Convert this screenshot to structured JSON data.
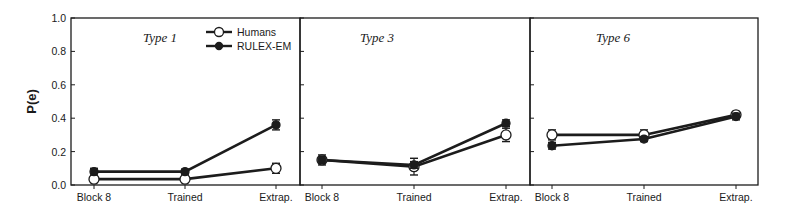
{
  "chart_data": {
    "type": "line",
    "ylabel": "P(e)",
    "ylim": [
      0.0,
      1.0
    ],
    "yticks": [
      "0.0",
      "0.2",
      "0.4",
      "0.6",
      "0.8",
      "1.0"
    ],
    "categories": [
      "Block 8",
      "Trained",
      "Extrap."
    ],
    "grid": false,
    "legend": {
      "position": "upper-right of first panel",
      "entries": [
        {
          "name": "Humans",
          "marker": "open-circle"
        },
        {
          "name": "RULEX-EM",
          "marker": "filled-circle"
        }
      ]
    },
    "panels": [
      {
        "title": "Type 1",
        "series": [
          {
            "name": "Humans",
            "values": [
              0.035,
              0.035,
              0.1
            ],
            "errors": [
              0.02,
              0.02,
              0.03
            ]
          },
          {
            "name": "RULEX-EM",
            "values": [
              0.08,
              0.08,
              0.36
            ],
            "errors": [
              0.02,
              0.015,
              0.03
            ]
          }
        ]
      },
      {
        "title": "Type 3",
        "series": [
          {
            "name": "Humans",
            "values": [
              0.15,
              0.11,
              0.3
            ],
            "errors": [
              0.03,
              0.05,
              0.04
            ]
          },
          {
            "name": "RULEX-EM",
            "values": [
              0.15,
              0.12,
              0.37
            ],
            "errors": [
              0.02,
              0.02,
              0.02
            ]
          }
        ]
      },
      {
        "title": "Type 6",
        "series": [
          {
            "name": "Humans",
            "values": [
              0.3,
              0.3,
              0.42
            ],
            "errors": [
              0.03,
              0.03,
              0.02
            ]
          },
          {
            "name": "RULEX-EM",
            "values": [
              0.235,
              0.275,
              0.41
            ],
            "errors": [
              0.02,
              0.015,
              0.02
            ]
          }
        ]
      }
    ]
  }
}
